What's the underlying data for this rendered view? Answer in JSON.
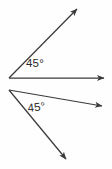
{
  "figure": {
    "background_color": "#fefefe",
    "stroke_color": "#3a3a3a",
    "label_color": "#2b2b2b",
    "width": 112,
    "height": 169
  },
  "angles": [
    {
      "id": "top-angle",
      "label": "45°",
      "measure": 45,
      "unit": "degrees",
      "vertex": {
        "x": 9,
        "y": 78
      },
      "rays": [
        {
          "id": "top-angle-horizontal-ray",
          "name": "horizontal-ray",
          "from": {
            "x": 9,
            "y": 78
          },
          "to": {
            "x": 108,
            "y": 78
          },
          "arrowhead": true
        },
        {
          "id": "top-angle-diagonal-ray",
          "name": "upward-diagonal-ray",
          "from": {
            "x": 9,
            "y": 78
          },
          "to": {
            "x": 80,
            "y": 6
          },
          "arrowhead": true
        }
      ]
    },
    {
      "id": "bottom-angle",
      "label": "45°",
      "measure": 45,
      "unit": "degrees",
      "vertex": {
        "x": 9,
        "y": 90
      },
      "rays": [
        {
          "id": "bottom-angle-upper-ray",
          "name": "upper-right-ray",
          "from": {
            "x": 9,
            "y": 90
          },
          "to": {
            "x": 106,
            "y": 107
          },
          "arrowhead": true
        },
        {
          "id": "bottom-angle-lower-ray",
          "name": "lower-right-ray",
          "from": {
            "x": 9,
            "y": 90
          },
          "to": {
            "x": 69,
            "y": 163
          },
          "arrowhead": true
        }
      ]
    }
  ]
}
